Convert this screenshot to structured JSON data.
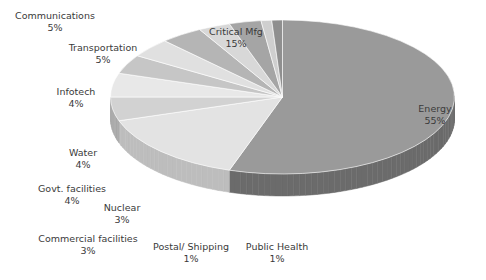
{
  "chart_data": {
    "type": "pie",
    "title": "",
    "subtitle": "",
    "xlabel": "",
    "ylabel": "",
    "legend_position": "none",
    "grid": false,
    "three_d": true,
    "units": "percent",
    "categories": [
      "Energy",
      "Critical Mfg",
      "Communications",
      "Transportation",
      "Infotech",
      "Water",
      "Govt. facilities",
      "Nuclear",
      "Commercial facilities",
      "Postal/ Shipping",
      "Public Health"
    ],
    "values": [
      55,
      15,
      5,
      5,
      4,
      4,
      4,
      3,
      3,
      1,
      1
    ],
    "slices": [
      {
        "label": "Energy",
        "percent_text": "55%",
        "value": 55,
        "color": "#9a9a9a",
        "side_color": "#6b6b6b"
      },
      {
        "label": "Critical Mfg",
        "percent_text": "15%",
        "value": 15,
        "color": "#e3e3e3",
        "side_color": "#bdbdbd"
      },
      {
        "label": "Communications",
        "percent_text": "5%",
        "value": 5,
        "color": "#d2d2d2",
        "side_color": "#a8a8a8"
      },
      {
        "label": "Transportation",
        "percent_text": "5%",
        "value": 5,
        "color": "#e8e8e8",
        "side_color": "#c2c2c2"
      },
      {
        "label": "Infotech",
        "percent_text": "4%",
        "value": 4,
        "color": "#c6c6c6",
        "side_color": "#9d9d9d"
      },
      {
        "label": "Water",
        "percent_text": "4%",
        "value": 4,
        "color": "#e0e0e0",
        "side_color": "#b6b6b6"
      },
      {
        "label": "Govt. facilities",
        "percent_text": "4%",
        "value": 4,
        "color": "#b5b5b5",
        "side_color": "#8c8c8c"
      },
      {
        "label": "Nuclear",
        "percent_text": "3%",
        "value": 3,
        "color": "#d8d8d8",
        "side_color": "#ababab"
      },
      {
        "label": "Commercial facilities",
        "percent_text": "3%",
        "value": 3,
        "color": "#a5a5a5",
        "side_color": "#7e7e7e"
      },
      {
        "label": "Postal/ Shipping",
        "percent_text": "1%",
        "value": 1,
        "color": "#cfcfcf",
        "side_color": "#a0a0a0"
      },
      {
        "label": "Public Health",
        "percent_text": "1%",
        "value": 1,
        "color": "#8f8f8f",
        "side_color": "#6f6f6f"
      }
    ]
  },
  "labels": {
    "energy": {
      "name": "Energy",
      "pct": "55%"
    },
    "critical_mfg": {
      "name": "Critical Mfg",
      "pct": "15%"
    },
    "communications": {
      "name": "Communications",
      "pct": "5%"
    },
    "transportation": {
      "name": "Transportation",
      "pct": "5%"
    },
    "infotech": {
      "name": "Infotech",
      "pct": "4%"
    },
    "water": {
      "name": "Water",
      "pct": "4%"
    },
    "govt_facilities": {
      "name": "Govt. facilities",
      "pct": "4%"
    },
    "nuclear": {
      "name": "Nuclear",
      "pct": "3%"
    },
    "commercial_facilities": {
      "name": "Commercial facilities",
      "pct": "3%"
    },
    "postal_shipping": {
      "name": "Postal/ Shipping",
      "pct": "1%"
    },
    "public_health": {
      "name": "Public Health",
      "pct": "1%"
    }
  }
}
